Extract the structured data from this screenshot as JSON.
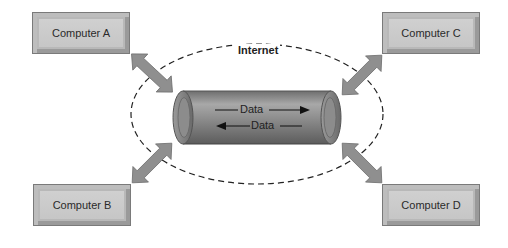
{
  "diagram": {
    "network_label": "Internet",
    "pipe": {
      "forward_label": "Data",
      "backward_label": "Data"
    },
    "nodes": [
      {
        "id": "A",
        "label": "Computer A"
      },
      {
        "id": "B",
        "label": "Computer B"
      },
      {
        "id": "C",
        "label": "Computer C"
      },
      {
        "id": "D",
        "label": "Computer D"
      }
    ],
    "colors": {
      "box_fill": "#c8c8c8",
      "arrow_fill": "#8f8f8f",
      "pipe_fill": "#8a8a8a",
      "dash": "#222222"
    }
  }
}
